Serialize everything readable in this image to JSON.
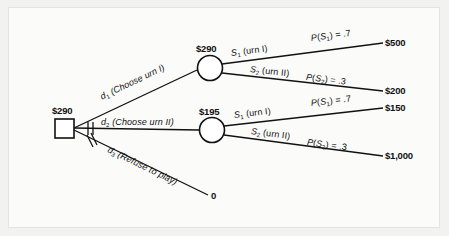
{
  "diagram": {
    "type": "decision-tree",
    "colors": {
      "line": "#111111",
      "node_fill": "#ffffff",
      "background": "#fbfbfa",
      "frame": "#f2f2f0"
    }
  },
  "decision_node": {
    "name": "root-decision-node",
    "shape": "square",
    "value_label": "$290",
    "x": 64,
    "y": 128
  },
  "branches": [
    {
      "id": "d1",
      "label": "d₁ (Choose urn I)",
      "label_plain": "d1 (Choose urn I)",
      "pruned": false,
      "target": "chance-node-urn-1"
    },
    {
      "id": "d2",
      "label": "d₂ (Choose urn II)",
      "label_plain": "d2 (Choose urn II)",
      "pruned": true,
      "target": "chance-node-urn-2"
    },
    {
      "id": "d3",
      "label": "d₃ (Refuse to play)",
      "label_plain": "d3 (Refuse to play)",
      "pruned": true,
      "target": "terminal-zero"
    }
  ],
  "chance_nodes": [
    {
      "id": "chance-node-urn-1",
      "shape": "circle",
      "value_label": "$290",
      "x": 210,
      "y": 68,
      "outcomes": [
        {
          "state_label": "S₁ (urn I)",
          "prob_label": "P(S₁) = .7",
          "probability": 0.7,
          "payoff_label": "$500",
          "payoff": 500
        },
        {
          "state_label": "S₂ (urn II)",
          "prob_label": "P(S₂) = .3",
          "probability": 0.3,
          "payoff_label": "$200",
          "payoff": 200
        }
      ]
    },
    {
      "id": "chance-node-urn-2",
      "shape": "circle",
      "value_label": "$195",
      "x": 212,
      "y": 130,
      "outcomes": [
        {
          "state_label": "S₁ (urn I)",
          "prob_label": "P(S₁) = .7",
          "probability": 0.7,
          "payoff_label": "$150",
          "payoff": 150
        },
        {
          "state_label": "S₂ (urn II)",
          "prob_label": "P(S₂) = .3",
          "probability": 0.3,
          "payoff_label": "$1,000",
          "payoff": 1000
        }
      ]
    }
  ],
  "terminal_zero": {
    "id": "terminal-zero",
    "label": "0",
    "x": 212,
    "y": 196
  },
  "labels": {
    "root_value": "$290",
    "node1_value": "$290",
    "node2_value": "$195",
    "d1": "d",
    "d1_sub": "1",
    "d1_text": " (Choose urn I)",
    "d2": "d",
    "d2_sub": "2",
    "d2_text": " (Choose urn II)",
    "d3": "d",
    "d3_sub": "3",
    "d3_text": " (Refuse to play)",
    "S": "S",
    "P": "P",
    "s1_sub": "1",
    "s2_sub": "2",
    "urn1_text": " (urn I)",
    "urn2_text": " (urn II)",
    "p1_text": ") = .7",
    "p2_text": ") = .3",
    "payoff_500": "$500",
    "payoff_200": "$200",
    "payoff_150": "$150",
    "payoff_1000": "$1,000",
    "zero": "0",
    "paren_open": "(",
    "paren_close": ")"
  }
}
